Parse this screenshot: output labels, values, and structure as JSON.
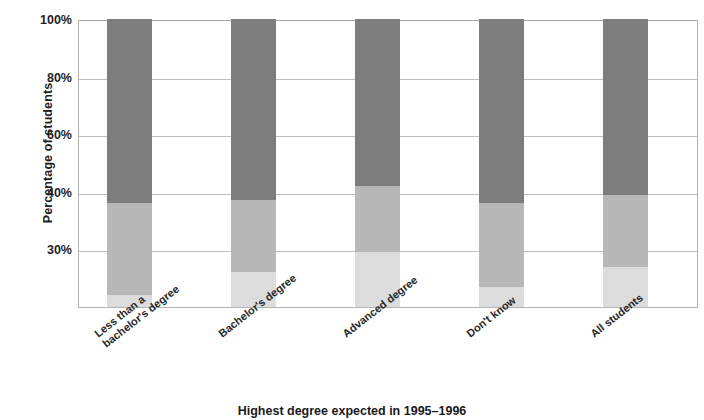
{
  "chart_data": {
    "type": "bar",
    "subtype": "stacked-bar-100",
    "title": "",
    "xlabel": "Highest degree expected in 1995–1996",
    "ylabel": "Percentage of students",
    "categories": [
      "Less than a bachelor's degree",
      "Bachelor's degree",
      "Advanced degree",
      "Don't know",
      "All students"
    ],
    "category_lines": [
      [
        "Less than a",
        "bachelor's degree"
      ],
      [
        "Bachelor's degree"
      ],
      [
        "Advanced degree"
      ],
      [
        "Don't know"
      ],
      [
        "All students"
      ]
    ],
    "ytick_labels": [
      "100%",
      "80%",
      "60%",
      "40%",
      "30%"
    ],
    "ytick_values": [
      100,
      80,
      60,
      40,
      20
    ],
    "ylim": [
      0,
      100
    ],
    "grid": true,
    "legend": "none",
    "series": [
      {
        "name": "bottom-segment",
        "color": "#dcdcdc",
        "values": [
          4,
          12,
          19,
          7,
          14
        ]
      },
      {
        "name": "middle-segment",
        "color": "#b7b7b7",
        "values": [
          32,
          25,
          23,
          29,
          25
        ]
      },
      {
        "name": "top-segment",
        "color": "#7d7d7d",
        "values": [
          64,
          63,
          58,
          64,
          61
        ]
      }
    ],
    "segment_tops_percent": [
      [
        4,
        36,
        100
      ],
      [
        12,
        37,
        100
      ],
      [
        19,
        42,
        100
      ],
      [
        7,
        36,
        100
      ],
      [
        14,
        39,
        100
      ]
    ]
  },
  "colors": {
    "segment_dark": "#7d7d7d",
    "segment_mid": "#b7b7b7",
    "segment_light": "#dcdcdc",
    "gridline": "#bdbdbd",
    "axis": "#b4b4b4",
    "text": "#1f1f1f",
    "background": "#ffffff"
  }
}
